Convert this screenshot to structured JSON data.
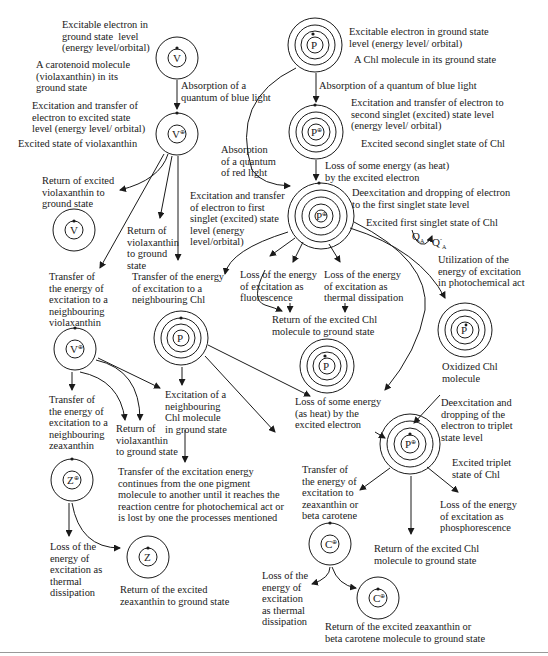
{
  "diagram": {
    "molecules": {
      "V": "V",
      "P": "P",
      "Z": "Z",
      "C": "C",
      "Q_A": "Q",
      "Q_A_sub": "A",
      "excited_mark": "⊕",
      "dot_mark": "•"
    },
    "left_branch": {
      "v_ground_electron": "Excitable electron in\nground state  level\n(energy level/orbital)",
      "v_ground_molecule": "A carotenoid molecule\n(violaxanthin) in its\nground state",
      "v_absorption": "Absorption of a\nquantum of blue light",
      "v_excitation": "Excitation and transfer of\nelectron to excited state\nlevel (energy level/ orbital)",
      "v_excited_state": "Excited state of violaxanthin",
      "v_return_excited": "Return of excited\nviolaxanthin to\nground state",
      "v_return_ground": "Return of\nviolaxanthin\nto ground\nstate",
      "transfer_to_violaxanthin": "Transfer of\nthe energy of\nexcitation to a\nneighbouring\nviolaxanthin",
      "transfer_to_chl": "Transfer of the energy\nof excitation to a\nneighbouring Chl",
      "transfer_to_zeaxanthin": "Transfer of\nthe energy of\nexcitation to a\nneighbouring\nzeaxanthin",
      "return_violaxanthin_2": "Return of\nviolaxanthin\nto ground state",
      "excitation_neighbour_chl": "Excitation of a\nneighbouring\nChl molecule\nin ground state",
      "transfer_continues": "Transfer of the excitation energy\ncontinues from the one pigment\nmolecule to another until it reaches the\nreaction centre for photochemical act or\nis lost by one the processes mentioned",
      "z_loss_thermal": "Loss of the\nenergy of\nexcitation as\nthermal\ndissipation",
      "z_return": "Return of the excited\nzeaxanthin to ground state"
    },
    "right_branch": {
      "p_ground_electron": "Excitable electron in ground state\nlevel (energy level/ orbital)",
      "p_ground_molecule": "A Chl molecule in its ground state",
      "p_absorption_blue": "Absorption of a quantum of blue light",
      "p_excitation_second": "Excitation and transfer of electron to\nsecond singlet (excited) state level\n(energy level/ orbital)",
      "p_excited_second": "Excited second singlet state of Chl",
      "p_absorption_red": "Absorption\nof a quantum\nof red light",
      "p_loss_heat_1": "Loss of some energy (as heat)\nby the excited electron",
      "p_excitation_first": "Excitation and transfer\nof electron to first\nsinglet (excited) state\nlevel (energy\nlevel/orbital)",
      "p_deexcitation_first": "Deexcitation and dropping of electron\nto the first singlet state level",
      "p_excited_first": "Excited first singlet state of Chl",
      "utilization": "Utilization of the\nenergy of excitation\nin photochemical act",
      "fluorescence": "Loss of the energy\nof excitation as\nfluorescence",
      "thermal": "Loss of the energy\nof excitation as\nthermal dissipation",
      "return_chl_1": "Return of the excited Chl\nmolecule to ground state",
      "oxidized": "Oxidized Chl\nmolecule",
      "loss_heat_2": "Loss of some energy\n(as heat) by the\nexcited electron",
      "deexcitation_triplet": "Deexcitation and\ndropping of the\nelectron to triplet\nstate level",
      "excited_triplet": "Excited triplet\nstate of Chl",
      "transfer_zea_beta": "Transfer of\nthe energy of\nexcitation to\nzeaxanthin or\nbeta carotene",
      "phosphorescence": "Loss of the energy\nof excitation as\nphosphorescence",
      "return_chl_2": "Return of the excited Chl\nmolecule to ground state",
      "c_loss_thermal": "Loss of the\nenergy of\nexcitation\nas thermal\ndissipation",
      "c_return": "Return of the excited zeaxanthin or\nbeta carotene molecule to ground state"
    }
  }
}
